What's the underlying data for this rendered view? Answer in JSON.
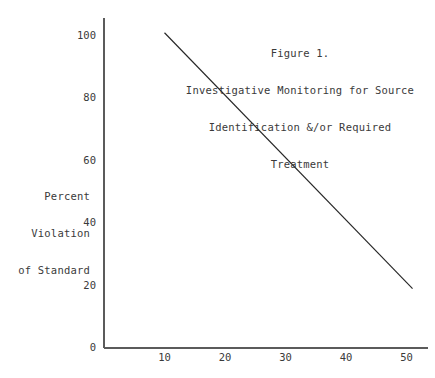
{
  "chart_data": {
    "type": "line",
    "title": "Figure 1.\nInvestigative Monitoring for Source\nIdentification &/or Required\nTreatment",
    "title_lines": [
      "Figure 1.",
      "Investigative Monitoring for Source",
      "Identification &/or Required",
      "Treatment"
    ],
    "xlabel": "",
    "ylabel": "Percent Violation of Standard",
    "ylabel_lines": [
      "Percent",
      "Violation",
      "of Standard"
    ],
    "xlim": [
      0,
      55
    ],
    "ylim": [
      0,
      105
    ],
    "grid": false,
    "legend": null,
    "xticks": [
      10,
      20,
      30,
      40,
      50
    ],
    "xtick_labels": [
      "10",
      "20",
      "30",
      "40",
      "50"
    ],
    "yticks": [
      0,
      20,
      40,
      60,
      80,
      100
    ],
    "ytick_labels": [
      "0",
      "20",
      "40",
      "60",
      "80",
      "100"
    ],
    "series": [
      {
        "name": "Percent violation of standard",
        "x": [
          10,
          51
        ],
        "values": [
          101,
          19
        ],
        "color": "#262626"
      }
    ]
  },
  "style": {
    "axis_color": "#5b5b5b",
    "text_color": "#3a3a3a",
    "line_color": "#262626",
    "background": "#ffffff"
  }
}
